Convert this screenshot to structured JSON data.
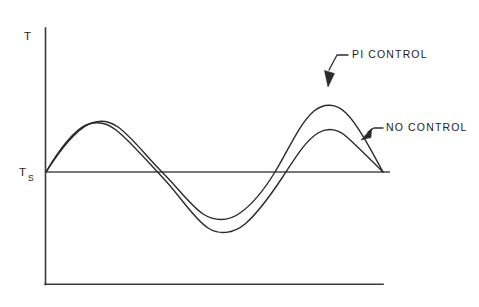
{
  "figure": {
    "background_color": "#ffffff",
    "line_color": "#2b2b2b",
    "axis_color": "#3a3a3a"
  },
  "axes": {
    "y_axis_label": "T",
    "setpoint_label_main": "T",
    "setpoint_label_sub": "S",
    "x_axis_label": "",
    "x_axis_tick_labels": [],
    "y_axis_tick_labels": [],
    "grid": false,
    "y_axis_top_px": 28,
    "y_axis_bottom_px": 284,
    "x_axis_left_px": 45,
    "x_axis_right_px": 383,
    "setpoint_y_px": 172,
    "setpoint_line_right_px": 390
  },
  "callouts": [
    {
      "id": "pi-control",
      "label": "PI CONTROL",
      "text_x": 352,
      "text_y": 55,
      "leader_start_x": 348,
      "leader_start_y": 55,
      "leader_mid_x": 337,
      "leader_mid_y": 55,
      "arrow_tip_x": 328,
      "arrow_tip_y": 86,
      "arrow_angle_deg": 253
    },
    {
      "id": "no-control",
      "label": "NO CONTROL",
      "text_x": 386,
      "text_y": 128,
      "leader_start_x": 383,
      "leader_start_y": 128,
      "leader_mid_x": 374,
      "leader_mid_y": 128,
      "arrow_tip_x": 362,
      "arrow_tip_y": 139,
      "arrow_angle_deg": 227
    }
  ],
  "chart_data": {
    "type": "line",
    "title": "",
    "xlabel": "",
    "ylabel": "T",
    "grid": false,
    "legend_position": "inline-callouts",
    "setpoint": {
      "label": "Ts",
      "value": 0,
      "description": "Setpoint temperature baseline"
    },
    "x": [
      0,
      0.05,
      0.1,
      0.15,
      0.2,
      0.25,
      0.3,
      0.35,
      0.4,
      0.45,
      0.5,
      0.55,
      0.6,
      0.65,
      0.7,
      0.75,
      0.8,
      0.85,
      0.9,
      0.95,
      1.0
    ],
    "series": [
      {
        "name": "PI CONTROL",
        "values": [
          0.0,
          0.28,
          0.52,
          0.69,
          0.78,
          0.76,
          0.64,
          0.43,
          0.17,
          -0.11,
          -0.34,
          -0.48,
          -0.52,
          -0.44,
          -0.25,
          0.06,
          0.44,
          0.78,
          0.97,
          0.84,
          0.0
        ],
        "peak1": 0.78,
        "trough": -0.52,
        "peak2": 0.97,
        "description": "Taller second peak, shallower trough"
      },
      {
        "name": "NO CONTROL",
        "values": [
          0.0,
          0.3,
          0.55,
          0.71,
          0.75,
          0.7,
          0.56,
          0.34,
          0.07,
          -0.22,
          -0.48,
          -0.66,
          -0.74,
          -0.69,
          -0.5,
          -0.2,
          0.14,
          0.42,
          0.58,
          0.5,
          0.0
        ],
        "peak1": 0.75,
        "trough": -0.74,
        "peak2": 0.58,
        "description": "Lower second peak, deeper trough"
      }
    ],
    "ylim": [
      -1.15,
      1.12
    ],
    "xlim": [
      0,
      1.0
    ]
  },
  "curve_paths": {
    "pi_control": "M 46,172 C 60,150 74,131 89,124 C 98,120 108,120 118,127 C 132,137 146,156 162,172 C 178,188 190,205 203,214 C 214,221 228,222 240,213 C 253,204 264,190 275,172 C 288,151 299,124 314,111 C 324,103 336,103 346,113 C 358,125 370,148 383,172",
    "no_control": "M 46,172 C 59,150 72,132 86,125 C 96,121 106,122 116,130 C 130,141 147,161 164,179 C 180,196 194,219 208,228 C 219,235 233,234 245,224 C 258,213 270,196 282,178 C 294,160 305,141 318,133 C 328,127 339,129 348,138 C 360,149 372,161 383,172"
  }
}
